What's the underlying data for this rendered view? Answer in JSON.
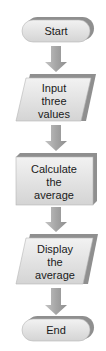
{
  "flowchart": {
    "nodes": [
      {
        "id": "start",
        "type": "terminator",
        "lines": [
          "Start"
        ]
      },
      {
        "id": "input",
        "type": "input-output",
        "lines": [
          "Input",
          "three",
          "values"
        ]
      },
      {
        "id": "calculate",
        "type": "process",
        "lines": [
          "Calculate",
          "the",
          "average"
        ]
      },
      {
        "id": "display",
        "type": "input-output",
        "lines": [
          "Display",
          "the",
          "average"
        ]
      },
      {
        "id": "end",
        "type": "terminator",
        "lines": [
          "End"
        ]
      }
    ],
    "edges": [
      {
        "from": "start",
        "to": "input"
      },
      {
        "from": "input",
        "to": "calculate"
      },
      {
        "from": "calculate",
        "to": "display"
      },
      {
        "from": "display",
        "to": "end"
      }
    ],
    "colors": {
      "shape_fill": "#d9d9d9",
      "shape_light": "#eeeeee",
      "shape_side": "#9a9a9a",
      "arrow_fill": "#a8a8a8",
      "text": "#1a1a1a"
    }
  }
}
